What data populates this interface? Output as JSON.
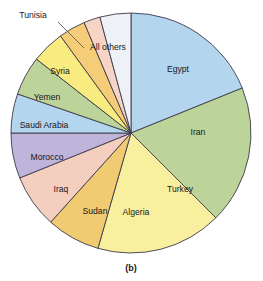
{
  "figure": {
    "caption": "(b)",
    "background_color": "#ffffff"
  },
  "chart_data": {
    "type": "pie",
    "title": "",
    "subtitle": "",
    "xlabel": "",
    "ylabel": "",
    "legend_position": "none",
    "labels_position": "inside-slices",
    "grid": false,
    "start_angle_deg": 0,
    "direction": "clockwise",
    "center": {
      "x": 131,
      "y": 133
    },
    "radius": 120,
    "categories": [
      "Egypt",
      "Iran",
      "Turkey",
      "Algeria",
      "Sudan",
      "Iraq",
      "Morocco",
      "Saudi Arabia",
      "Yemen",
      "Syria",
      "Tunisia",
      "All others"
    ],
    "values": [
      18.9,
      18.6,
      16.9,
      7.2,
      7.2,
      6.1,
      5.3,
      5.3,
      4.4,
      3.6,
      2.2,
      4.3
    ],
    "slices": [
      {
        "label": "Egypt",
        "value": 18.9,
        "start_deg": 0,
        "end_deg": 68,
        "color": "#b4d5ee",
        "label_style": "inside",
        "label_x": 178,
        "label_y": 70
      },
      {
        "label": "Iran",
        "value": 18.6,
        "start_deg": 68,
        "end_deg": 135,
        "color": "#bcd49a",
        "label_style": "inside",
        "label_y": 133,
        "label_x": 198
      },
      {
        "label": "Turkey",
        "value": 16.9,
        "start_deg": 135,
        "end_deg": 196,
        "color": "#f8f09e",
        "label_style": "inside",
        "label_x": 180,
        "label_y": 190
      },
      {
        "label": "Algeria",
        "value": 7.2,
        "start_deg": 196,
        "end_deg": 222,
        "color": "#f1cb72",
        "label_style": "inside",
        "label_x": 136,
        "label_y": 213
      },
      {
        "label": "Sudan",
        "value": 7.2,
        "start_deg": 222,
        "end_deg": 248,
        "color": "#f4cfc0",
        "label_style": "inside",
        "label_x": 95,
        "label_y": 212
      },
      {
        "label": "Iraq",
        "value": 6.1,
        "start_deg": 248,
        "end_deg": 270,
        "color": "#bfb4da",
        "label_style": "inside",
        "label_x": 61,
        "label_y": 190
      },
      {
        "label": "Morocco",
        "value": 5.3,
        "start_deg": 270,
        "end_deg": 289,
        "color": "#b4d5ee",
        "label_style": "inside",
        "label_x": 47,
        "label_y": 158
      },
      {
        "label": "Saudi Arabia",
        "value": 5.3,
        "start_deg": 289,
        "end_deg": 308,
        "color": "#bcd49a",
        "label_style": "inside",
        "label_x": 44,
        "label_y": 126
      },
      {
        "label": "Yemen",
        "value": 4.4,
        "start_deg": 308,
        "end_deg": 324,
        "color": "#f8ec80",
        "label_style": "inside",
        "label_x": 47,
        "label_y": 98
      },
      {
        "label": "Syria",
        "value": 3.6,
        "start_deg": 324,
        "end_deg": 337,
        "color": "#f5cd78",
        "label_style": "inside",
        "label_x": 60,
        "label_y": 72
      },
      {
        "label": "Tunisia",
        "value": 2.2,
        "start_deg": 337,
        "end_deg": 345,
        "color": "#f7d5c6",
        "label_style": "callout",
        "label_x": 33,
        "label_y": 16,
        "leader": {
          "x1": 58,
          "y1": 22,
          "x2": 84,
          "y2": 48
        }
      },
      {
        "label": "All others",
        "value": 4.3,
        "start_deg": 345,
        "end_deg": 360,
        "color": "#eef1f5",
        "label_style": "inside",
        "label_x": 108,
        "label_y": 48
      }
    ]
  }
}
